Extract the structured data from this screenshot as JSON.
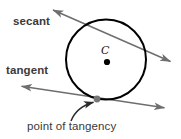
{
  "figure": {
    "background_color": "#ffffff",
    "width": 181,
    "height": 139
  },
  "labels": {
    "secant": "secant",
    "tangent": "tangent",
    "point_of_tangency": "point of tangency",
    "center": "C"
  },
  "colors": {
    "circle_stroke": "#000000",
    "line_stroke": "#6e6e6e",
    "center_dot": "#000000",
    "tangency_dot": "#777777",
    "pointer_stroke": "#2b2b2b",
    "text": "#3a3a3a"
  },
  "geometry": {
    "circle": {
      "cx": 106,
      "cy": 59.5,
      "r": 40,
      "stroke_width": 2
    },
    "center_point": {
      "x": 107,
      "y": 62
    },
    "tangency_point": {
      "x": 97,
      "y": 99
    },
    "secant_line": {
      "x1": 52,
      "y1": 9,
      "x2": 172,
      "y2": 62,
      "arrowheads": "both"
    },
    "tangent_line": {
      "x1": 20,
      "y1": 86,
      "x2": 166,
      "y2": 108,
      "arrowheads": "both"
    },
    "pointer_arrow": {
      "from_x": 71,
      "from_y": 121,
      "to_x": 96,
      "to_y": 101
    }
  }
}
